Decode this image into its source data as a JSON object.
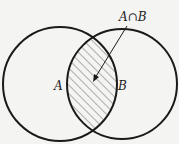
{
  "diagram": {
    "type": "venn",
    "sets": [
      {
        "name": "A",
        "label": "A"
      },
      {
        "name": "B",
        "label": "B"
      }
    ],
    "intersection_label": "A∩B",
    "shaded_region": "A∩B",
    "colors": {
      "stroke": "#1a1a1a",
      "hatch": "#555555",
      "background": "#f4f4f2"
    }
  }
}
